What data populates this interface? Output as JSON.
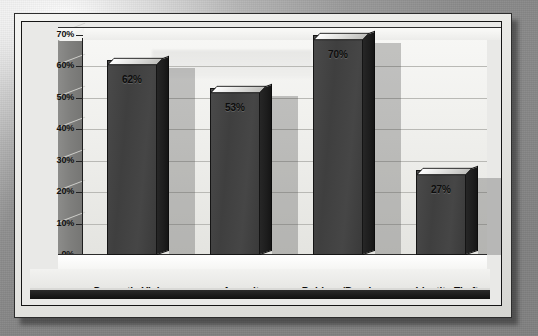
{
  "chart_data": {
    "type": "bar",
    "title": "",
    "subtitle": "",
    "xlabel": "",
    "ylabel": "",
    "categories": [
      "Domestic Violence",
      "Assault",
      "Robbery/Burglary",
      "Identity Theft"
    ],
    "values": [
      62,
      53,
      70,
      27
    ],
    "value_labels": [
      "62%",
      "53%",
      "70%",
      "27%"
    ],
    "ylim": [
      0,
      70
    ],
    "ytick_values": [
      0,
      10,
      20,
      30,
      40,
      50,
      60,
      70
    ],
    "ytick_labels": [
      "0%",
      "10%",
      "20%",
      "30%",
      "40%",
      "50%",
      "60%",
      "70%"
    ],
    "grid": true,
    "legend": false,
    "legend_position": "none",
    "style": "3d-column",
    "units": "percent",
    "colors": {
      "bar_front": "#424242",
      "bar_side": "#1c1c1c",
      "bar_top": "#e0e0de",
      "plot_background": "#f1f1ee",
      "wall_side": "#7e7e7c",
      "gridline": "#b9b9b5",
      "axis": "#1e1e1e",
      "label_text": "#0c0c0c",
      "page_background": "#8f8f8f",
      "frame": "#e9e9e7",
      "base_band": "#1a1a1a"
    }
  }
}
